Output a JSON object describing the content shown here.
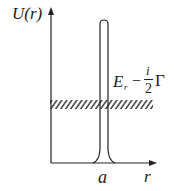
{
  "diagram": {
    "y_axis_label": "U(r)",
    "x_axis_label": "r",
    "barrier_position_label": "a",
    "energy_label": {
      "main": "E",
      "subscript": "r",
      "minus": "−",
      "fraction_numerator": "i",
      "fraction_denominator": "2",
      "gamma": "Γ"
    },
    "colors": {
      "line": "#222222",
      "background": "#ffffff"
    }
  }
}
